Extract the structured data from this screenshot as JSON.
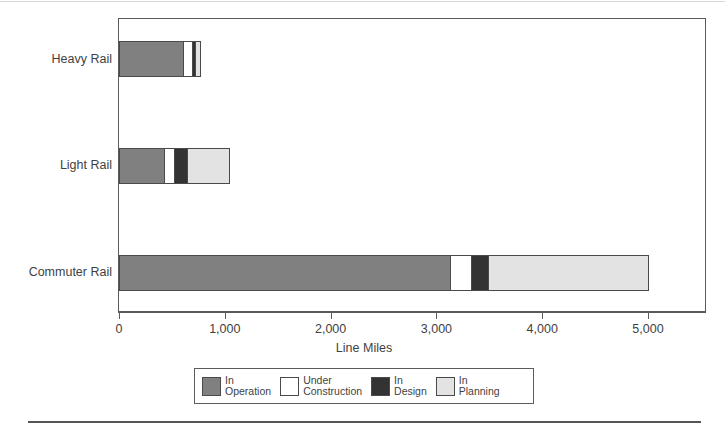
{
  "chart_data": {
    "type": "bar",
    "orientation": "horizontal",
    "stacked": true,
    "title": "",
    "xlabel": "Line Miles",
    "ylabel": "",
    "xlim": [
      0,
      5000
    ],
    "xticks": [
      0,
      1000,
      2000,
      3000,
      4000,
      5000
    ],
    "xticklabels": [
      "0",
      "1,000",
      "2,000",
      "3,000",
      "4,000",
      "5,000"
    ],
    "categories": [
      "Heavy Rail",
      "Light Rail",
      "Commuter Rail"
    ],
    "grid": false,
    "legend_position": "bottom",
    "series": [
      {
        "name": "In Operation",
        "label_line1": "In",
        "label_line2": "Operation",
        "color": "#808080",
        "values": [
          605,
          425,
          3130
        ]
      },
      {
        "name": "Under Construction",
        "label_line1": "Under",
        "label_line2": "Construction",
        "color": "#ffffff",
        "values": [
          85,
          95,
          200
        ]
      },
      {
        "name": "In Design",
        "label_line1": "In",
        "label_line2": "Design",
        "color": "#333333",
        "values": [
          30,
          123,
          160
        ]
      },
      {
        "name": "In Planning",
        "label_line1": "In",
        "label_line2": "Planning",
        "color": "#e3e3e3",
        "values": [
          45,
          397,
          1510
        ]
      }
    ]
  },
  "axis": {
    "x_title": "Line Miles",
    "tick_0": "0",
    "tick_1": "1,000",
    "tick_2": "2,000",
    "tick_3": "3,000",
    "tick_4": "4,000",
    "tick_5": "5,000"
  },
  "categories": {
    "heavy_rail": "Heavy Rail",
    "light_rail": "Light Rail",
    "commuter_rail": "Commuter Rail"
  },
  "legend": {
    "items": [
      {
        "line1": "In",
        "line2": "Operation"
      },
      {
        "line1": "Under",
        "line2": "Construction"
      },
      {
        "line1": "In",
        "line2": "Design"
      },
      {
        "line1": "In",
        "line2": "Planning"
      }
    ]
  },
  "footer": {
    "caption": ""
  }
}
